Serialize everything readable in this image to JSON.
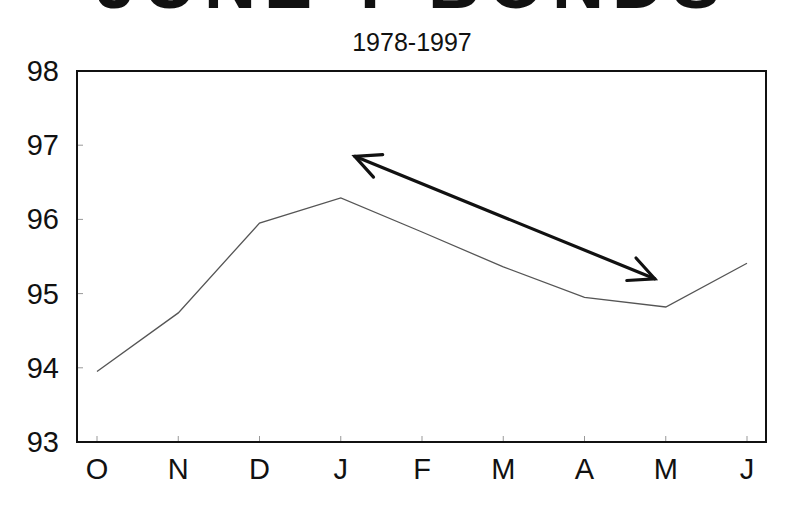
{
  "chart_data": {
    "type": "line",
    "title": "JUNE T-BONDS",
    "subtitle": "1978-1997",
    "xlabel": "",
    "ylabel": "",
    "categories": [
      "O",
      "N",
      "D",
      "J",
      "F",
      "M",
      "A",
      "M",
      "J"
    ],
    "series": [
      {
        "name": "Seasonal pattern",
        "values": [
          93.95,
          94.74,
          95.95,
          96.29,
          95.83,
          95.36,
          94.95,
          94.82,
          95.41
        ],
        "color": "#555555"
      }
    ],
    "ylim": [
      93,
      98
    ],
    "yticks": [
      93,
      94,
      95,
      96,
      97,
      98
    ],
    "grid": false,
    "legend": null,
    "annotations": [
      {
        "type": "double-arrow",
        "from_category": "J",
        "to_category": "M",
        "from_value": 96.85,
        "to_value": 95.2,
        "color": "#111111",
        "description": "Double-headed arrow highlighting the decline from January peak to May low"
      }
    ]
  }
}
